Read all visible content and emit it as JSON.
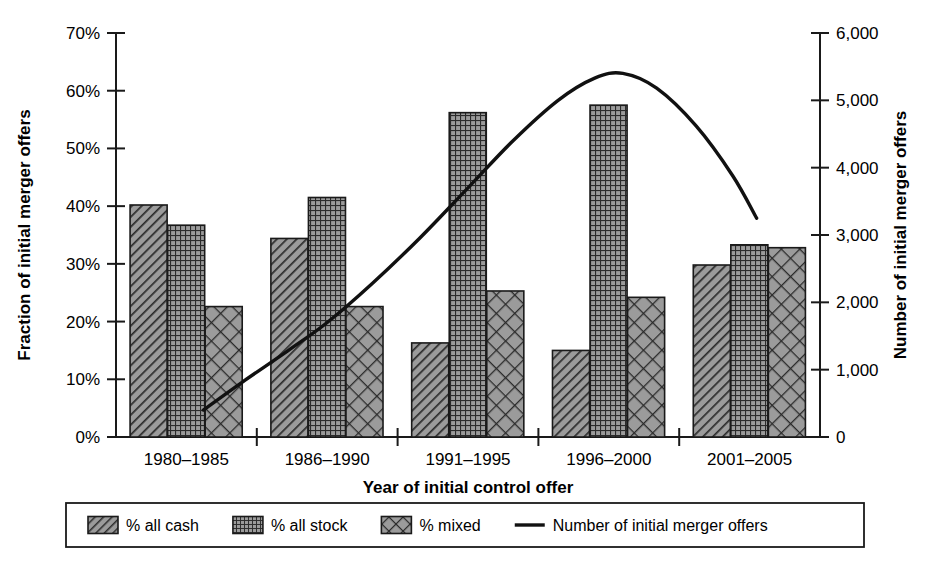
{
  "chart_data": {
    "type": "bar",
    "title": "",
    "categories": [
      "1980–1985",
      "1986–1990",
      "1991–1995",
      "1996–2000",
      "2001–2005"
    ],
    "xlabel": "Year of initial control offer",
    "ylabel": "Fraction of initial merger offers",
    "ylabel_right": "Number of initial merger offers",
    "ylim": [
      0,
      70
    ],
    "ylim_right": [
      0,
      6000
    ],
    "yticks": [
      0,
      10,
      20,
      30,
      40,
      50,
      60,
      70
    ],
    "ytick_labels": [
      "0%",
      "10%",
      "20%",
      "30%",
      "40%",
      "50%",
      "60%",
      "70%"
    ],
    "yticks_right": [
      0,
      1000,
      2000,
      3000,
      4000,
      5000,
      6000
    ],
    "ytick_labels_right": [
      "0",
      "1,000",
      "2,000",
      "3,000",
      "4,000",
      "5,000",
      "6,000"
    ],
    "grid": false,
    "legend_position": "bottom",
    "series": [
      {
        "name": "% all cash",
        "kind": "bar",
        "pattern": "diagonal-hatch",
        "axis": "left",
        "values": [
          40.2,
          34.4,
          16.3,
          15.0,
          29.8
        ]
      },
      {
        "name": "% all stock",
        "kind": "bar",
        "pattern": "fine-grid",
        "axis": "left",
        "values": [
          36.7,
          41.5,
          56.2,
          57.5,
          33.3
        ]
      },
      {
        "name": "% mixed",
        "kind": "bar",
        "pattern": "cross-hatch",
        "axis": "left",
        "values": [
          22.6,
          22.6,
          25.3,
          24.2,
          32.8
        ]
      },
      {
        "name": "Number of initial merger offers",
        "kind": "line",
        "pattern": "solid-line",
        "axis": "right",
        "values": [
          400,
          1700,
          3700,
          5350,
          3250
        ],
        "curve_points": [
          [
            0.12,
            400
          ],
          [
            0.4,
            820
          ],
          [
            0.72,
            1280
          ],
          [
            1.0,
            1700
          ],
          [
            1.32,
            2280
          ],
          [
            1.66,
            2960
          ],
          [
            2.0,
            3700
          ],
          [
            2.32,
            4400
          ],
          [
            2.64,
            5000
          ],
          [
            2.9,
            5330
          ],
          [
            3.1,
            5400
          ],
          [
            3.34,
            5180
          ],
          [
            3.62,
            4620
          ],
          [
            3.88,
            3880
          ],
          [
            4.05,
            3250
          ]
        ]
      }
    ]
  },
  "legend": {
    "entries": [
      {
        "label": "% all cash",
        "marker": "diagonal-hatch"
      },
      {
        "label": "% all stock",
        "marker": "fine-grid"
      },
      {
        "label": "% mixed",
        "marker": "cross-hatch"
      },
      {
        "label": "Number of initial merger offers",
        "marker": "solid-line"
      }
    ]
  },
  "colors": {
    "bar_fill": "#8a8a8a",
    "bar_fill_light": "#9b9b9b",
    "hatch": "#2b2b2b",
    "outline": "#1a1a1a",
    "line": "#111111",
    "background": "#ffffff"
  }
}
